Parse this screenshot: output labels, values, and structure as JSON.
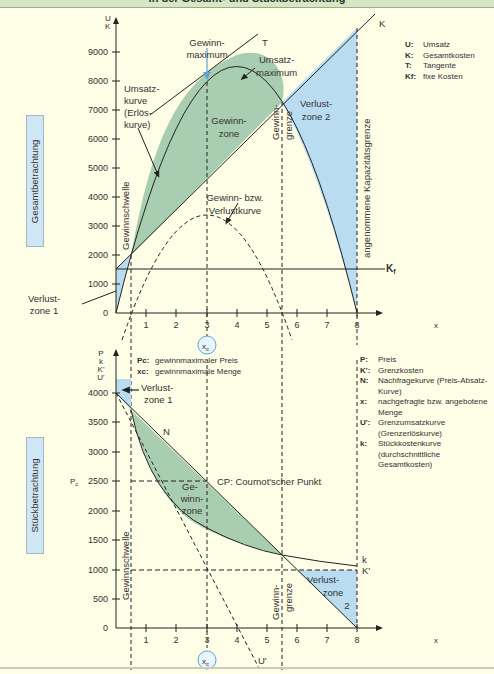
{
  "title": "in der Gesamt- und Stückbetrachtung",
  "colors": {
    "background": "#fefde6",
    "title_bar": "#d7e6c4",
    "profit_zone": "#a9cdb0",
    "loss_zone": "#b9dcf0",
    "side_label": "#cfe6f4",
    "line": "#2b2b2b",
    "marker_arrow": "#5aa6d6"
  },
  "top_chart": {
    "side_label": "Gesamtbetrachtung",
    "y_axis_label_1": "U",
    "y_axis_label_2": "K",
    "x_axis_label": "x",
    "y_ticks": [
      "0",
      "1000",
      "2000",
      "3000",
      "4000",
      "5000",
      "6000",
      "7000",
      "8000",
      "9000"
    ],
    "x_ticks": [
      "1",
      "2",
      "3",
      "4",
      "5",
      "6",
      "7",
      "8"
    ],
    "x_marker": "x",
    "x_marker_sub": "c",
    "labels": {
      "gewinnmaximum_1": "Gewinn-",
      "gewinnmaximum_2": "maximum",
      "t": "T",
      "k": "K",
      "kf": "K",
      "kf_sub": "f",
      "umsatzmaximum_1": "Umsatz-",
      "umsatzmaximum_2": "maximum",
      "umsatzkurve_1": "Umsatz-",
      "umsatzkurve_2": "kurve",
      "umsatzkurve_3": "(Erlös-",
      "umsatzkurve_4": "kurve)",
      "gewinnzone_1": "Gewinn-",
      "gewinnzone_2": "zone",
      "verlustzone2_1": "Verlust-",
      "verlustzone2_2": "zone 2",
      "gewinngrenze_1": "Gewinn-",
      "gewinngrenze_2": "grenze",
      "kapazitaet": "angenommene Kapazitätsgrenze",
      "gewinnschwelle": "Gewinnschwelle",
      "gv_kurve_1": "Gewinn- bzw.",
      "gv_kurve_2": "Verlustkurve",
      "verlustzone1_1": "Verlust-",
      "verlustzone1_2": "zone 1"
    },
    "legend": [
      {
        "key": "U:",
        "value": "Umsatz"
      },
      {
        "key": "K:",
        "value": "Gesamtkosten"
      },
      {
        "key": "T:",
        "value": "Tangente"
      },
      {
        "key": "Kf:",
        "value": "fixe Kosten"
      }
    ]
  },
  "bottom_chart": {
    "side_label": "Stückbetrachtung",
    "y_axis_labels": [
      "P",
      "k",
      "K'",
      "U'"
    ],
    "x_axis_label": "x",
    "pc_label": "P",
    "pc_sub": "c",
    "y_ticks": [
      "0",
      "500",
      "1000",
      "1500",
      "2000",
      "2500",
      "3000",
      "3500",
      "4000"
    ],
    "x_ticks": [
      "1",
      "2",
      "3",
      "4",
      "5",
      "6",
      "7",
      "8"
    ],
    "x_marker": "x",
    "x_marker_sub": "c",
    "labels": {
      "n": "N",
      "cp": "CP: Cournot'scher Punkt",
      "gewinnzone_1": "Ge-",
      "gewinnzone_2": "winn-",
      "gewinnzone_3": "zone",
      "verlustzone1_1": "Verlust-",
      "verlustzone1_2": "zone 1",
      "verlustzone2_1": "Verlust-",
      "verlustzone2_2": "zone",
      "verlustzone2_3": "2",
      "gewinngrenze_1": "Gewinn-",
      "gewinngrenze_2": "grenze",
      "gewinnschwelle": "Gewinnschwelle",
      "k": "k",
      "kprime": "K'",
      "uprime": "U'"
    },
    "notes": [
      {
        "key": "Pc:",
        "value": "gewinnmaximaler Preis"
      },
      {
        "key": "xc:",
        "value": "gewinnmaximale Menge"
      }
    ],
    "legend": [
      {
        "key": "P:",
        "value": "Preis"
      },
      {
        "key": "K':",
        "value": "Grenzkosten"
      },
      {
        "key": "N:",
        "value": "Nachfragekurve (Preis-Absatz-Kurve)"
      },
      {
        "key": "x:",
        "value": "nachgefragte bzw. angebotene Menge"
      },
      {
        "key": "U':",
        "value": "Grenzumsatzkurve (Grenzerlöskurve)"
      },
      {
        "key": "k:",
        "value": "Stückkostenkurve (durchschnittliche Gesamtkosten)"
      }
    ]
  }
}
